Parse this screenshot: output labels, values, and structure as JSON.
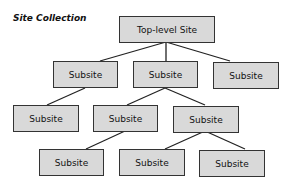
{
  "diagram": {
    "title": "Site Collection",
    "colors": {
      "node_fill": "#d9d9d9",
      "node_border": "#333333",
      "line": "#222222"
    },
    "nodes": {
      "root": {
        "label": "Top-level Site"
      },
      "l1a": {
        "label": "Subsite"
      },
      "l1b": {
        "label": "Subsite"
      },
      "l1c": {
        "label": "Subsite"
      },
      "l2a": {
        "label": "Subsite"
      },
      "l2b": {
        "label": "Subsite"
      },
      "l2c": {
        "label": "Subsite"
      },
      "l3a": {
        "label": "Subsite"
      },
      "l3b": {
        "label": "Subsite"
      },
      "l3c": {
        "label": "Subsite"
      }
    },
    "edges": [
      [
        "root",
        "l1a"
      ],
      [
        "root",
        "l1b"
      ],
      [
        "root",
        "l1c"
      ],
      [
        "l1a",
        "l2a"
      ],
      [
        "l1b",
        "l2b"
      ],
      [
        "l1b",
        "l2c"
      ],
      [
        "l2b",
        "l3a"
      ],
      [
        "l2c",
        "l3b"
      ],
      [
        "l2c",
        "l3c"
      ]
    ]
  }
}
